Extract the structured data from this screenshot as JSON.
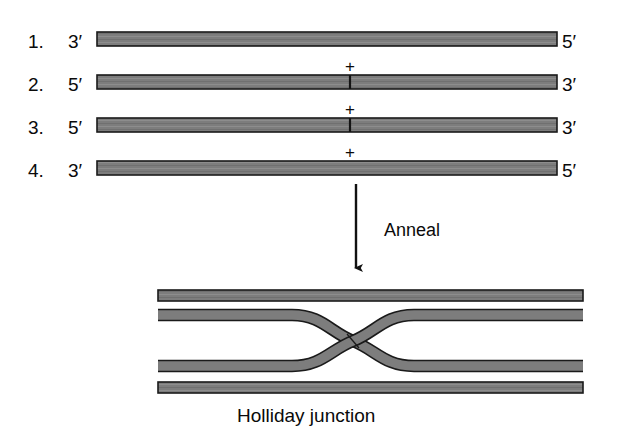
{
  "figure": {
    "background_color": "#ffffff",
    "strand_fill": "#7d7d7d",
    "strand_outline": "#1a1a1a",
    "text_color": "#0a0a0a"
  },
  "strands": [
    {
      "number": "1.",
      "left_end": "3′",
      "right_end": "5′",
      "nick": false
    },
    {
      "number": "2.",
      "left_end": "5′",
      "right_end": "3′",
      "nick": true
    },
    {
      "number": "3.",
      "left_end": "5′",
      "right_end": "3′",
      "nick": true
    },
    {
      "number": "4.",
      "left_end": "3′",
      "right_end": "5′",
      "nick": false
    }
  ],
  "operators": {
    "plus": "+",
    "plus_count": 3
  },
  "process": {
    "arrow_label": "Anneal",
    "arrow_direction": "down"
  },
  "product": {
    "caption": "Holliday junction",
    "duplex_count": 2,
    "crossing_strands": 2
  }
}
